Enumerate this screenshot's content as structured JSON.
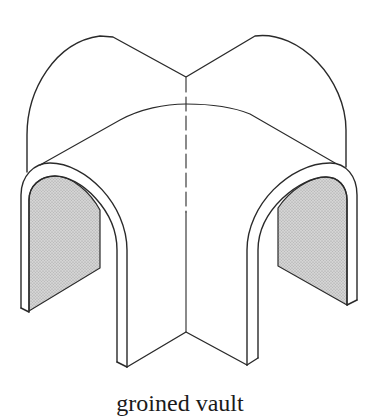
{
  "figure": {
    "caption": "groined vault",
    "colors": {
      "line": "#2a2a2a",
      "shading": "#cfcfcf",
      "shading_dots": "#9a9a9a",
      "background": "#ffffff"
    },
    "parts": [
      {
        "name": "left barrel vault",
        "description": "upper-left curved vault surface"
      },
      {
        "name": "right barrel vault",
        "description": "upper-right curved vault surface"
      },
      {
        "name": "groin line",
        "description": "dashed central intersection line"
      },
      {
        "name": "left arch opening",
        "description": "shaded arch opening on the left"
      },
      {
        "name": "right arch opening",
        "description": "shaded arch opening on the right"
      },
      {
        "name": "central pier",
        "description": "front corner pier with V-shaped base"
      }
    ]
  }
}
